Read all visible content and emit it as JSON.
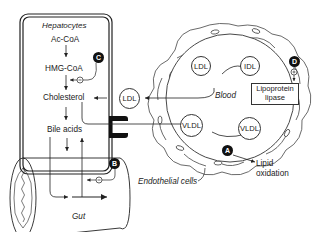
{
  "hepatocyte": {
    "title": "Hepatocytes",
    "steps": [
      "Ac-CoA",
      "HMG-CoA",
      "Cholesterol",
      "Bile acids"
    ]
  },
  "blood": {
    "label": "Blood",
    "particles": {
      "ldl_receptor": "LDL",
      "ldl_top": "LDL",
      "idl": "IDL",
      "vldl_left": "VLDL",
      "vldl_right": "VLDL"
    },
    "enzyme": "Lipoprotein lipase"
  },
  "gut": {
    "label": "Gut"
  },
  "labels": {
    "endothelial": "Endothelial cells",
    "lipid_oxidation": "Lipid oxidation"
  },
  "markers": {
    "A": "A",
    "B": "B",
    "C": "C",
    "D": "D"
  },
  "signs": {
    "minus": "−",
    "plus": "+"
  },
  "colors": {
    "line": "#333333",
    "badge": "#111111"
  }
}
